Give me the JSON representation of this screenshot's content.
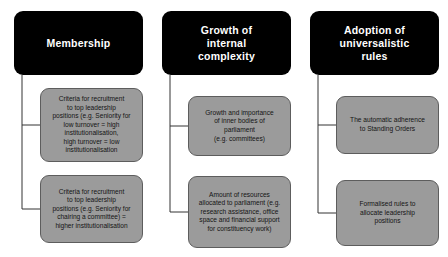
{
  "diagram": {
    "background_color": "#ffffff",
    "header_color": "#000000",
    "header_text_color": "#ffffff",
    "box_color": "#9b9b9b",
    "box_border_color": "#5d5d5d",
    "connector_color": "#333333",
    "columns": [
      {
        "header": "Membership",
        "items": [
          "Criteria for recruitment\nto top leadership\npositions (e.g. Seniority for\nlow turnover = high\ninstitutionalisation,\nhigh turnover = low\ninstitutionalisation",
          "Criteria for recruitment\nto top leadership\npositions (e.g. Seniority for\nchairing a committee) =\nhigher institutionalisation"
        ]
      },
      {
        "header": "Growth of\ninternal\ncomplexity",
        "items": [
          "Growth and importance\nof inner bodies of\nparliament\n(e.g. committees)",
          "Amount of resources\nallocated to parliament (e.g.\nresearch assistance, office\nspace and financial support\nfor constituency work)"
        ]
      },
      {
        "header": "Adoption of\nuniversalistic\nrules",
        "items": [
          "The automatic adherence\nto Standing Orders",
          "Formalised rules to\nallocate leadership\npositions"
        ]
      }
    ]
  }
}
